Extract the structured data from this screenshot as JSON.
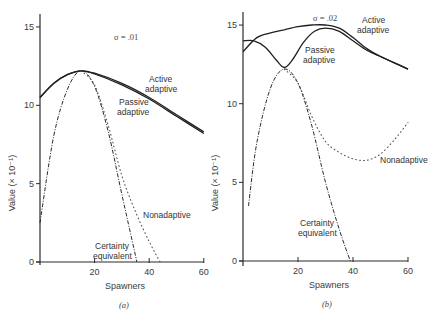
{
  "figure": {
    "panels": [
      {
        "caption": "(a)",
        "sigma_label": "σ = .01",
        "xlabel": "Spawners",
        "ylabel": "Value (× 10⁻¹)",
        "x_ticks": [
          "20",
          "40",
          "60"
        ],
        "y_ticks": [
          "0",
          "5",
          "10",
          "15"
        ],
        "labels": {
          "active": [
            "Active",
            "adaptive"
          ],
          "passive": [
            "Passive",
            "adaptive"
          ],
          "nonadaptive": "Nonadaptive",
          "certainty": [
            "Certainty",
            "equivalent"
          ]
        }
      },
      {
        "caption": "(b)",
        "sigma_label": "σ = .02",
        "xlabel": "Spawners",
        "ylabel": "Value (× 10⁻¹)",
        "x_ticks": [
          "20",
          "40",
          "60"
        ],
        "y_ticks": [
          "0",
          "5",
          "10",
          "15"
        ],
        "labels": {
          "active": [
            "Active",
            "adaptive"
          ],
          "passive": [
            "Passive",
            "adaptive"
          ],
          "nonadaptive": "Nonadaptive",
          "certainty": [
            "Certainty",
            "equivalent"
          ]
        }
      }
    ]
  },
  "chart_data": [
    {
      "type": "line",
      "title": "(a) σ = .01",
      "xlabel": "Spawners",
      "ylabel": "Value (× 10⁻¹)",
      "xlim": [
        0,
        60
      ],
      "ylim": [
        0,
        15
      ],
      "x_ticks": [
        20,
        40,
        60
      ],
      "y_ticks": [
        0,
        5,
        10,
        15
      ],
      "grid": false,
      "series": [
        {
          "name": "Active adaptive",
          "style": "solid",
          "x": [
            0,
            5,
            10,
            15,
            20,
            30,
            40,
            50,
            60
          ],
          "y": [
            10.5,
            11.4,
            11.95,
            12.2,
            12.05,
            11.4,
            10.5,
            9.4,
            8.3
          ]
        },
        {
          "name": "Passive adaptive",
          "style": "solid",
          "x": [
            0,
            5,
            10,
            15,
            20,
            30,
            40,
            50,
            60
          ],
          "y": [
            10.5,
            11.4,
            11.95,
            12.2,
            12.0,
            11.3,
            10.4,
            9.3,
            8.2
          ]
        },
        {
          "name": "Certainty equivalent",
          "style": "dash-dot",
          "x": [
            0,
            5,
            10,
            15,
            20,
            25,
            30,
            35.5
          ],
          "y": [
            2.5,
            8.0,
            11.0,
            12.2,
            11.2,
            8.3,
            4.3,
            0
          ]
        },
        {
          "name": "Nonadaptive",
          "style": "dotted",
          "x": [
            15,
            20,
            25,
            30,
            35,
            40,
            44
          ],
          "y": [
            12.2,
            11.3,
            8.7,
            5.5,
            3.2,
            1.3,
            0
          ]
        }
      ]
    },
    {
      "type": "line",
      "title": "(b) σ = .02",
      "xlabel": "Spawners",
      "ylabel": "Value (× 10⁻¹)",
      "xlim": [
        0,
        60
      ],
      "ylim": [
        0,
        15
      ],
      "x_ticks": [
        20,
        40,
        60
      ],
      "y_ticks": [
        0,
        5,
        10,
        15
      ],
      "grid": false,
      "series": [
        {
          "name": "Active adaptive",
          "style": "solid",
          "x": [
            0,
            5,
            10,
            15,
            20,
            25,
            30,
            35,
            40,
            45,
            50,
            55,
            60
          ],
          "y": [
            13.3,
            14.2,
            14.5,
            14.7,
            14.9,
            15.0,
            15.0,
            14.8,
            14.2,
            13.5,
            13.0,
            12.6,
            12.2
          ]
        },
        {
          "name": "Passive adaptive",
          "style": "solid",
          "x": [
            0,
            4,
            8,
            12,
            15,
            18,
            22,
            26,
            30,
            35,
            40,
            45,
            50,
            55,
            60
          ],
          "y": [
            14.0,
            14.0,
            13.6,
            12.8,
            12.3,
            12.8,
            13.9,
            14.6,
            14.8,
            14.6,
            14.0,
            13.4,
            13.0,
            12.6,
            12.2
          ]
        },
        {
          "name": "Certainty equivalent",
          "style": "dash-dot",
          "x": [
            2,
            5,
            10,
            15,
            20,
            25,
            30,
            35,
            39
          ],
          "y": [
            3.5,
            7.5,
            11.0,
            12.2,
            11.3,
            8.6,
            5.0,
            2.0,
            0
          ]
        },
        {
          "name": "Nonadaptive",
          "style": "dotted",
          "x": [
            15,
            20,
            25,
            30,
            35,
            40,
            45,
            50,
            55,
            60
          ],
          "y": [
            12.2,
            11.3,
            9.2,
            7.6,
            6.9,
            6.5,
            6.4,
            6.8,
            7.7,
            8.8
          ]
        }
      ]
    }
  ]
}
